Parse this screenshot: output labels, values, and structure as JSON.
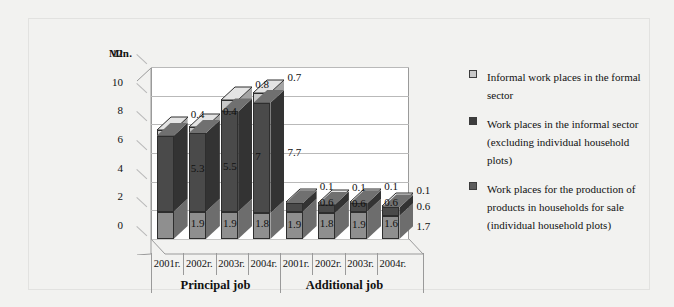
{
  "chart_data": {
    "type": "bar",
    "title": "",
    "subtitle": "",
    "ylabel": "Mln.",
    "xlabel": "",
    "ylim": [
      0,
      12
    ],
    "yticks": [
      0,
      2,
      4,
      6,
      8,
      10,
      12
    ],
    "grid": true,
    "stacked": true,
    "three_d": true,
    "legend_position": "right",
    "group_labels": [
      "Principal job",
      "Additional job"
    ],
    "categories": [
      "2001г.",
      "2002г.",
      "2003г.",
      "2004г.",
      "2001г.",
      "2002г.",
      "2003г.",
      "2004г."
    ],
    "series": [
      {
        "name": "Work places for the production of products in households for sale (individual household plots)",
        "color": "#8f8f8f",
        "values": [
          1.9,
          1.9,
          1.9,
          1.8,
          1.9,
          1.8,
          1.9,
          1.6
        ]
      },
      {
        "name": "Work places in the informal sector (excluding individual household plots)",
        "color": "#4a4a4a",
        "values": [
          5.3,
          5.5,
          7.0,
          7.7,
          0.6,
          0.6,
          0.6,
          0.6
        ]
      },
      {
        "name": "Informal work places in the formal sector",
        "color": "#c8c8c8",
        "values": [
          0.4,
          0.4,
          0.8,
          0.7,
          0.1,
          0.1,
          0.1,
          0.1
        ]
      }
    ],
    "data_labels": {
      "bottom": [
        "1.9",
        "1.9",
        "1.8",
        "1.9",
        "1.8",
        "1.9",
        "1.6",
        "1.7"
      ],
      "middle": [
        "5.3",
        "5.5",
        "7",
        "7.7",
        "0.6",
        "0.6",
        "0.6",
        "0.6"
      ],
      "top": [
        "0.4",
        "0.4",
        "0.8",
        "0.7",
        "0.1",
        "0.1",
        "0.1",
        "0.1"
      ]
    }
  },
  "legend": {
    "items": [
      {
        "label": "Informal work places in the formal sector",
        "color": "#c8c8c8"
      },
      {
        "label": "Work places in the informal sector (excluding individual household plots)",
        "color": "#3d3d3d"
      },
      {
        "label": "Work places for the production of products in households for sale (individual household plots)",
        "color": "#5c5c5c"
      }
    ]
  },
  "colors": {
    "page_background": "#f2f2f0",
    "plot_background": "#ffffff",
    "gridline": "#b9b9b9",
    "axis": "#9a9a9a",
    "text": "#111111",
    "series_light": "#c8c8c8",
    "series_dark": "#4a4a4a",
    "series_medium": "#8f8f8f"
  }
}
